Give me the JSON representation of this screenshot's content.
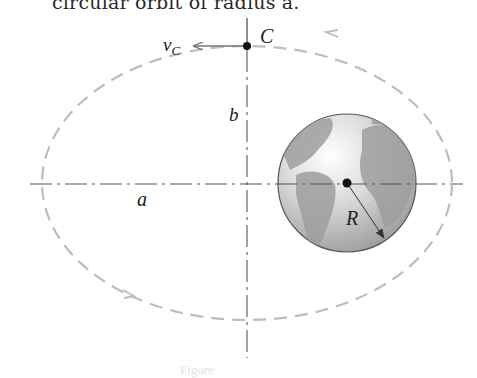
{
  "figure": {
    "top_caption": "circular orbit of radius a.",
    "bottom_caption": "Figure",
    "labels": {
      "velocity": "v",
      "velocity_subscript": "C",
      "point": "C",
      "semi_minor_axis": "b",
      "semi_major_axis": "a",
      "earth_radius": "R"
    },
    "elements": {
      "orbit": "elliptical orbit (dashed)",
      "earth": "Earth globe",
      "axes": "major and minor axes (dash-dot)",
      "velocity_vector": "arrow pointing left at C",
      "radius_vector": "arrow from Earth center to surface"
    },
    "colors": {
      "orbit": "#bdbdbd",
      "axis": "#555555",
      "earth_ocean": "#e2e2e2",
      "earth_land": "#9a9a9a",
      "arrow": "#777777",
      "point": "#111111"
    }
  }
}
